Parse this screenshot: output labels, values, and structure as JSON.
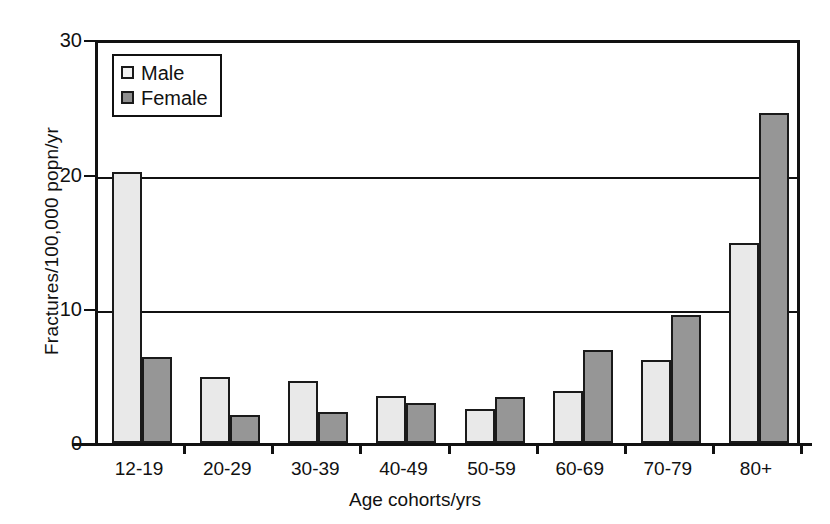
{
  "chart_data": {
    "type": "bar",
    "title": "",
    "xlabel": "Age cohorts/yrs",
    "ylabel": "Fractures/100,000 popn/yr",
    "categories": [
      "12-19",
      "20-29",
      "30-39",
      "40-49",
      "50-59",
      "60-69",
      "70-79",
      "80+"
    ],
    "series": [
      {
        "name": "Male",
        "color": "#e9e9e9",
        "values": [
          20.2,
          4.9,
          4.6,
          3.5,
          2.5,
          3.9,
          6.2,
          14.9
        ]
      },
      {
        "name": "Female",
        "color": "#969696",
        "values": [
          6.4,
          2.1,
          2.3,
          3.0,
          3.4,
          6.9,
          9.5,
          24.6
        ]
      }
    ],
    "ylim": [
      0,
      30
    ],
    "yticks": [
      0,
      10,
      20,
      30
    ],
    "ytick_labels": [
      "0",
      "10",
      "20",
      "30"
    ],
    "grid": "horizontal-major",
    "legend_position": "top-left-inside",
    "legend_entries": [
      "Male",
      "Female"
    ]
  }
}
